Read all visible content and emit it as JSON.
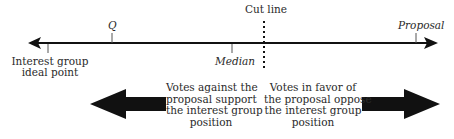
{
  "diagram": {
    "axis": {
      "labels": {
        "q": "Q",
        "cut_line": "Cut line",
        "proposal": "Proposal",
        "median": "Median",
        "interest_group_line1": "Interest group",
        "interest_group_line2": "ideal point"
      }
    },
    "captions": {
      "against": {
        "line1": "Votes against the",
        "line2": "proposal support",
        "line3": "the interest group",
        "line4": "position"
      },
      "favor": {
        "line1": "Votes in favor of",
        "line2": "the proposal oppose",
        "line3": "the interest group",
        "line4": "position"
      }
    },
    "colors": {
      "ink": "#111111",
      "text": "#2a2a2a",
      "background": "#ffffff"
    }
  }
}
